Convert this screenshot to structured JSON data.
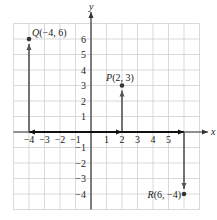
{
  "diagram": {
    "type": "coordinate-plane",
    "axes": {
      "x_label": "x",
      "y_label": "y",
      "x_ticks": [
        "-4",
        "-3",
        "-2",
        "-1",
        "1",
        "2",
        "3",
        "4",
        "5"
      ],
      "y_ticks": [
        "6",
        "5",
        "4",
        "3",
        "2",
        "1",
        "-1",
        "-2",
        "-3",
        "-4"
      ],
      "x_range": [
        -5,
        7
      ],
      "y_range": [
        -5,
        7
      ]
    },
    "points": [
      {
        "name": "Q",
        "label": "Q(−4, 6)",
        "x": -4,
        "y": 6
      },
      {
        "name": "P",
        "label": "P(2, 3)",
        "x": 2,
        "y": 3
      },
      {
        "name": "R",
        "label": "R(6, −4)",
        "x": 6,
        "y": -4
      }
    ],
    "colors": {
      "grid": "#cfcfcf",
      "axis": "#333333",
      "arrow": "#555555",
      "point": "#333333",
      "background": "#ffffff"
    }
  }
}
